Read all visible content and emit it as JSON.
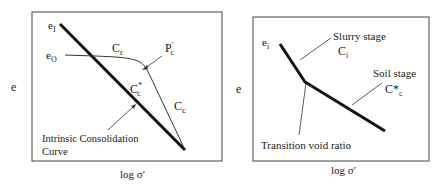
{
  "left_diagram": {
    "y_axis_label": "e",
    "x_axis_label": "log σ′",
    "labels": {
      "ei": "e",
      "ei_sub": "I",
      "eo": "e",
      "eo_sub": "O",
      "cr": "C",
      "cr_sub": "r",
      "pc": "P",
      "pc_sup": "′",
      "pc_sub": "c",
      "cc_star": "C",
      "cc_star_sub": "c",
      "cc_star_sup": "*",
      "cc": "C",
      "cc_sub": "c",
      "icc_line1": "Intrinsic Consolidation",
      "icc_line2": "Curve"
    }
  },
  "right_diagram": {
    "y_axis_label": "e",
    "x_axis_label": "log σ′",
    "labels": {
      "ei": "e",
      "ei_sub": "i",
      "slurry_stage": "Slurry stage",
      "ci": "C",
      "ci_sub": "i",
      "soil_stage": "Soil stage",
      "cc_star": "C*",
      "cc_star_sub": "c",
      "transition": "Transition void ratio"
    }
  }
}
